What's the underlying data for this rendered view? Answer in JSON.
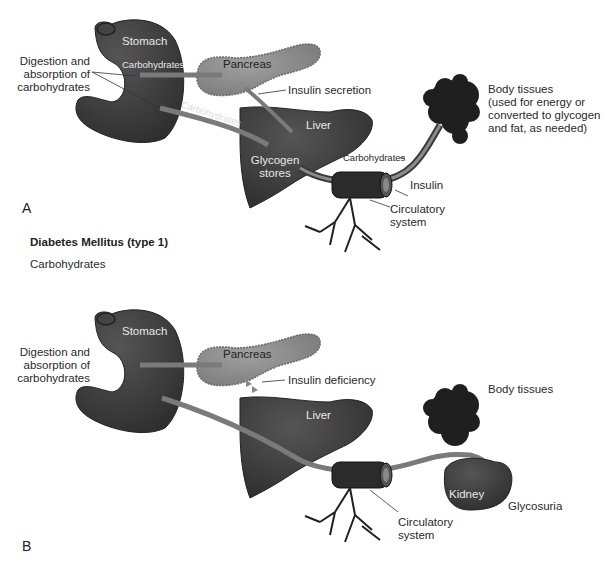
{
  "colors": {
    "organ_dark": "#3b3b3b",
    "pancreas": "#8a8a8a",
    "pathway": "#7a7a7a",
    "text": "#2a2a2a"
  },
  "panel_a": {
    "letter": "A",
    "labels": {
      "stomach": "Stomach",
      "carbohydrates_stomach": "Carbohydrates",
      "digestion": [
        "Digestion and",
        "absorption of",
        "carbohydrates"
      ],
      "pancreas": "Pancreas",
      "insulin_secretion": "Insulin secretion",
      "carbohydrates_path": "Carbohydrates",
      "liver": "Liver",
      "glycogen": [
        "Glycogen",
        "stores"
      ],
      "carbohydrates_vessel": "Carbohydrates",
      "insulin": "Insulin",
      "circulatory": [
        "Circulatory",
        "system"
      ],
      "body_tissues": [
        "Body tissues",
        "(used for energy or",
        "converted to glycogen",
        "and fat, as needed)"
      ]
    }
  },
  "section_heading": "Diabetes Mellitus (type 1)",
  "section_subheading": "Carbohydrates",
  "panel_b": {
    "letter": "B",
    "labels": {
      "stomach": "Stomach",
      "digestion": [
        "Digestion and",
        "absorption of",
        "carbohydrates"
      ],
      "pancreas": "Pancreas",
      "insulin_deficiency": "Insulin deficiency",
      "liver": "Liver",
      "body_tissues": "Body tissues",
      "kidney": "Kidney",
      "glycosuria": "Glycosuria",
      "circulatory": [
        "Circulatory",
        "system"
      ]
    }
  }
}
